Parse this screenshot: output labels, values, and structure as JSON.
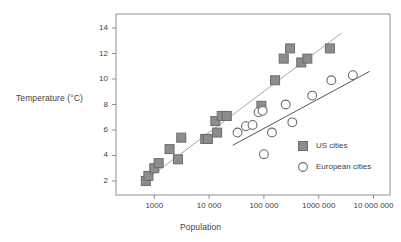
{
  "chart_data": {
    "type": "scatter",
    "title": "",
    "xlabel": "Population",
    "ylabel": "Temperature (°C)",
    "x_scale": "log",
    "xlim": [
      200,
      20000000
    ],
    "ylim": [
      0.9,
      15.1
    ],
    "grid": false,
    "legend_position": "inside-bottom-right",
    "x_ticks": [
      {
        "value": 1000,
        "label": "1000"
      },
      {
        "value": 10000,
        "label": "10 000"
      },
      {
        "value": 100000,
        "label": "100 000"
      },
      {
        "value": 1000000,
        "label": "1000 000"
      },
      {
        "value": 10000000,
        "label": "10 000 000"
      }
    ],
    "y_ticks": [
      {
        "value": 2,
        "label": "2"
      },
      {
        "value": 4,
        "label": "4"
      },
      {
        "value": 6,
        "label": "6"
      },
      {
        "value": 8,
        "label": "8"
      },
      {
        "value": 10,
        "label": "10"
      },
      {
        "value": 12,
        "label": "12"
      },
      {
        "value": 14,
        "label": "14"
      }
    ],
    "series": [
      {
        "name": "US cities",
        "marker": "filled-square",
        "color": "#8d8d8d",
        "edge_color": "#6b6b6b",
        "points": [
          {
            "x": 700,
            "y": 2.0
          },
          {
            "x": 780,
            "y": 2.4
          },
          {
            "x": 1000,
            "y": 3.0
          },
          {
            "x": 1200,
            "y": 3.4
          },
          {
            "x": 1900,
            "y": 4.5
          },
          {
            "x": 2700,
            "y": 3.7
          },
          {
            "x": 3100,
            "y": 5.4
          },
          {
            "x": 8500,
            "y": 5.3
          },
          {
            "x": 9500,
            "y": 5.3
          },
          {
            "x": 13000,
            "y": 6.7
          },
          {
            "x": 14000,
            "y": 5.8
          },
          {
            "x": 17000,
            "y": 7.1
          },
          {
            "x": 21000,
            "y": 7.1
          },
          {
            "x": 90000,
            "y": 7.9
          },
          {
            "x": 160000,
            "y": 9.9
          },
          {
            "x": 230000,
            "y": 11.6
          },
          {
            "x": 300000,
            "y": 12.4
          },
          {
            "x": 480000,
            "y": 11.3
          },
          {
            "x": 620000,
            "y": 11.6
          },
          {
            "x": 1600000,
            "y": 12.4
          }
        ]
      },
      {
        "name": "European cities",
        "marker": "open-circle",
        "color": "#ffffff",
        "edge_color": "#6b6b6b",
        "points": [
          {
            "x": 33000,
            "y": 5.8
          },
          {
            "x": 47000,
            "y": 6.3
          },
          {
            "x": 62000,
            "y": 6.4
          },
          {
            "x": 80000,
            "y": 7.4
          },
          {
            "x": 95000,
            "y": 7.5
          },
          {
            "x": 100000,
            "y": 4.1
          },
          {
            "x": 140000,
            "y": 5.8
          },
          {
            "x": 250000,
            "y": 8.0
          },
          {
            "x": 330000,
            "y": 6.6
          },
          {
            "x": 760000,
            "y": 8.7
          },
          {
            "x": 1700000,
            "y": 9.9
          },
          {
            "x": 4200000,
            "y": 10.3
          }
        ]
      }
    ],
    "trend_lines": [
      {
        "name": "US cities trend",
        "color": "#a9a9a9",
        "start": {
          "x": 620,
          "y": 1.9
        },
        "end": {
          "x": 2600000,
          "y": 13.6
        }
      },
      {
        "name": "European cities trend",
        "color": "#555555",
        "start": {
          "x": 27000,
          "y": 4.8
        },
        "end": {
          "x": 8500000,
          "y": 10.6
        }
      }
    ]
  },
  "legend": {
    "entries": [
      {
        "label": "US cities",
        "marker": "filled-square"
      },
      {
        "label": "European cities",
        "marker": "open-circle"
      }
    ]
  },
  "colors": {
    "frame": "#8f8f8f",
    "text": "#3f3f3f",
    "us_marker_fill": "#8d8d8d",
    "us_marker_edge": "#6b6b6b",
    "eu_marker_edge": "#6b6b6b",
    "us_trend": "#a9a9a9",
    "eu_trend": "#555555"
  }
}
